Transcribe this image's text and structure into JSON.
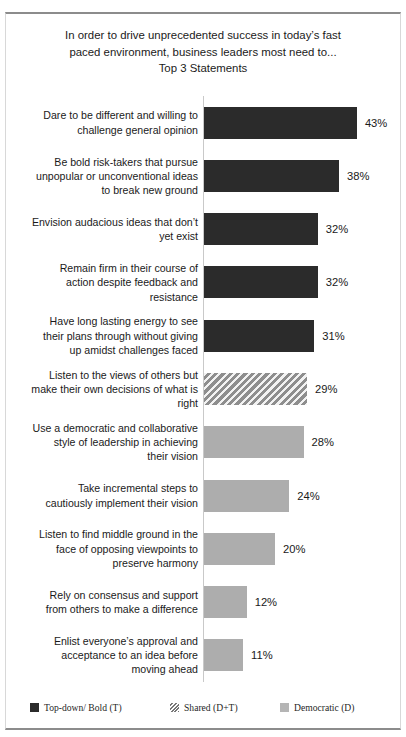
{
  "chart_data": {
    "type": "bar",
    "orientation": "horizontal",
    "title_lines": [
      "In order to drive unprecedented success in today’s fast",
      "paced environment, business leaders most need to...",
      "Top 3 Statements"
    ],
    "xlabel": "",
    "ylabel": "",
    "xlim": [
      0,
      45
    ],
    "grid": false,
    "legend_position": "bottom",
    "categories": [
      "Dare to be different and willing to challenge  general opinion",
      "Be bold risk-takers  that pursue unpopular or unconventional ideas to break new ground",
      "Envision audacious ideas that don’t yet exist",
      "Remain firm in their course of action despite feedback and resistance",
      "Have long lasting energy to see their plans through without giving up amidst challenges faced",
      "Listen to the views of others but make their own decisions of what is right",
      "Use a democratic and collaborative style of leadership  in achieving their vision",
      "Take incremental steps to cautiously implement their vision",
      "Listen to find middle ground in the face of opposing viewpoints  to preserve harmony",
      "Rely on consensus and support from others to make a difference",
      "Enlist everyone’s approval and acceptance to an idea before moving ahead"
    ],
    "values": [
      43,
      38,
      32,
      32,
      31,
      29,
      28,
      24,
      20,
      12,
      11
    ],
    "value_labels": [
      "43%",
      "38%",
      "32%",
      "32%",
      "31%",
      "29%",
      "28%",
      "24%",
      "20%",
      "12%",
      "11%"
    ],
    "series_group": [
      "bold",
      "bold",
      "bold",
      "bold",
      "bold",
      "shared",
      "democratic",
      "democratic",
      "democratic",
      "democratic",
      "democratic"
    ],
    "legend": [
      {
        "key": "bold",
        "label": "Top-down/ Bold (T)",
        "color": "#2b2b2b",
        "pattern": "solid"
      },
      {
        "key": "shared",
        "label": "Shared (D+T)",
        "color": "#9a9a9a",
        "pattern": "diagonal-hatch"
      },
      {
        "key": "democratic",
        "label": "Democratic (D)",
        "color": "#adadad",
        "pattern": "solid"
      }
    ]
  },
  "rows": [
    {
      "label_lines": [
        "Dare to be different and willing to",
        "challenge  general opinion"
      ],
      "value_label": "43%",
      "value": 43,
      "group": "bold"
    },
    {
      "label_lines": [
        "Be bold risk-takers  that pursue",
        "unpopular or unconventional ideas",
        "to break new ground"
      ],
      "value_label": "38%",
      "value": 38,
      "group": "bold"
    },
    {
      "label_lines": [
        "Envision audacious ideas that don’t",
        "yet exist"
      ],
      "value_label": "32%",
      "value": 32,
      "group": "bold"
    },
    {
      "label_lines": [
        "Remain firm in their course of",
        "action despite feedback and",
        "resistance"
      ],
      "value_label": "32%",
      "value": 32,
      "group": "bold"
    },
    {
      "label_lines": [
        "Have long lasting energy to see",
        "their plans through without giving",
        "up amidst challenges faced"
      ],
      "value_label": "31%",
      "value": 31,
      "group": "bold"
    },
    {
      "label_lines": [
        "Listen to the views of others but",
        "make their own decisions of what is",
        "right"
      ],
      "value_label": "29%",
      "value": 29,
      "group": "shared"
    },
    {
      "label_lines": [
        "Use a democratic and collaborative",
        "style of leadership  in achieving",
        "their vision"
      ],
      "value_label": "28%",
      "value": 28,
      "group": "democratic"
    },
    {
      "label_lines": [
        "Take incremental steps to",
        "cautiously implement their vision"
      ],
      "value_label": "24%",
      "value": 24,
      "group": "democratic"
    },
    {
      "label_lines": [
        "Listen to find middle ground in the",
        "face of opposing viewpoints  to",
        "preserve harmony"
      ],
      "value_label": "20%",
      "value": 20,
      "group": "democratic"
    },
    {
      "label_lines": [
        "Rely on consensus and support",
        "from others to make a difference"
      ],
      "value_label": "12%",
      "value": 12,
      "group": "democratic"
    },
    {
      "label_lines": [
        "Enlist everyone’s approval and",
        "acceptance to an idea before",
        "moving ahead"
      ],
      "value_label": "11%",
      "value": 11,
      "group": "democratic"
    }
  ]
}
